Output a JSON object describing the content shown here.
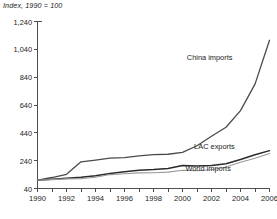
{
  "chart_data": {
    "type": "line",
    "title": "Index, 1990 = 100",
    "xlabel": "",
    "ylabel": "",
    "xlim": [
      1990,
      2006
    ],
    "ylim": [
      40,
      1240
    ],
    "yticks": [
      "40",
      "240",
      "440",
      "640",
      "840",
      "1,040",
      "1,240"
    ],
    "ytick_values": [
      40,
      240,
      440,
      640,
      840,
      1040,
      1240
    ],
    "xticks": [
      "1990",
      "1992",
      "1994",
      "1996",
      "1998",
      "2000",
      "2002",
      "2004",
      "2006"
    ],
    "xtick_values": [
      1990,
      1992,
      1994,
      1996,
      1998,
      2000,
      2002,
      2004,
      2006
    ],
    "grid": false,
    "legend_position": "inline-annotations",
    "x": [
      1990,
      1991,
      1992,
      1993,
      1994,
      1995,
      1996,
      1997,
      1998,
      1999,
      2000,
      2001,
      2002,
      2003,
      2004,
      2005,
      2006
    ],
    "series": [
      {
        "name": "China imports",
        "color": "#4a4a4a",
        "width": 1.3,
        "label_x": 2000.3,
        "label_y": 980,
        "values": [
          100,
          119,
          142,
          232,
          244,
          258,
          262,
          275,
          283,
          286,
          300,
          347,
          415,
          480,
          600,
          790,
          1105
        ]
      },
      {
        "name": "LAC exports",
        "color": "#2b2b2b",
        "width": 1.5,
        "label_x": 2000.8,
        "label_y": 340,
        "values": [
          100,
          106,
          113,
          120,
          131,
          148,
          160,
          172,
          176,
          183,
          205,
          202,
          205,
          218,
          248,
          282,
          312
        ]
      },
      {
        "name": "World imports",
        "color": "#9a9a9a",
        "width": 1.1,
        "label_x": 2000.2,
        "label_y": 182,
        "values": [
          100,
          104,
          109,
          110,
          121,
          140,
          146,
          152,
          153,
          158,
          171,
          168,
          175,
          195,
          228,
          258,
          292
        ]
      }
    ]
  }
}
